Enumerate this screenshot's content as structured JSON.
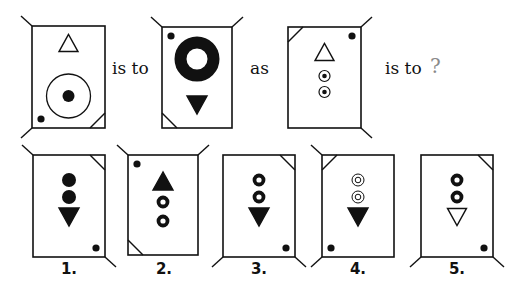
{
  "puzzle": {
    "type": "figure-analogy",
    "words": {
      "is_to_1": "is to",
      "as": "as",
      "is_to_2": "is to",
      "question_mark": "?"
    },
    "question_mark_color": "#8a8a8a",
    "figures": {
      "A": {
        "role": "premise-1",
        "corner_stubs": [
          "top-left",
          "bottom-left"
        ],
        "corner_cut": "bottom-right",
        "dot_corner": "bottom-left",
        "items": [
          "outline-triangle-up",
          "large-ring-with-dot"
        ]
      },
      "B": {
        "role": "premise-2",
        "corner_stubs": [
          "top-left",
          "top-right"
        ],
        "corner_cut": "bottom-left",
        "dot_corner": "top-left",
        "items": [
          "large-thick-ring",
          "solid-triangle-down"
        ]
      },
      "C": {
        "role": "premise-3",
        "corner_stubs": [
          "top-right",
          "bottom-right"
        ],
        "corner_cut": "top-left",
        "dot_corner": "top-right",
        "items": [
          "outline-triangle-up",
          "ring-with-dot",
          "ring-with-dot"
        ]
      }
    },
    "answers": [
      {
        "label": "1.",
        "corner_stubs": [
          "top-left",
          "bottom-right"
        ],
        "corner_cut": "top-right",
        "dot_corner": "bottom-right",
        "items": [
          "solid-circle",
          "solid-circle",
          "solid-triangle-down"
        ]
      },
      {
        "label": "2.",
        "corner_stubs": [
          "top-left",
          "top-right"
        ],
        "corner_cut": "bottom-left",
        "dot_corner": "top-left",
        "items": [
          "solid-triangle-up",
          "thick-ring",
          "thick-ring"
        ]
      },
      {
        "label": "3.",
        "corner_stubs": [
          "bottom-left",
          "bottom-right"
        ],
        "corner_cut": "top-right",
        "dot_corner": "bottom-right",
        "items": [
          "thick-ring",
          "thick-ring",
          "solid-triangle-down"
        ]
      },
      {
        "label": "4.",
        "corner_stubs": [
          "top-left",
          "bottom-left"
        ],
        "corner_cut": "top-left",
        "dot_corner": "bottom-left",
        "items": [
          "double-ring",
          "double-ring",
          "solid-triangle-down"
        ]
      },
      {
        "label": "5.",
        "corner_stubs": [
          "bottom-left",
          "bottom-right"
        ],
        "corner_cut": "top-right",
        "dot_corner": "bottom-right",
        "items": [
          "thick-ring",
          "thick-ring",
          "outline-triangle-down"
        ]
      }
    ]
  }
}
